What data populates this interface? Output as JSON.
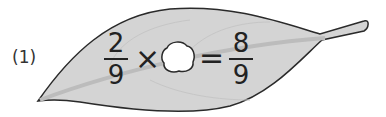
{
  "problem": {
    "label": "(1)",
    "left_fraction": {
      "numerator": "2",
      "denominator": "9"
    },
    "operator": "×",
    "unknown": "blank-hole",
    "equals": "=",
    "right_fraction": {
      "numerator": "8",
      "denominator": "9"
    }
  },
  "colors": {
    "leaf_fill": "#d4d4d4",
    "leaf_outline": "#2a2a2a",
    "vein": "#bcbcbc",
    "hole": "#ffffff"
  }
}
